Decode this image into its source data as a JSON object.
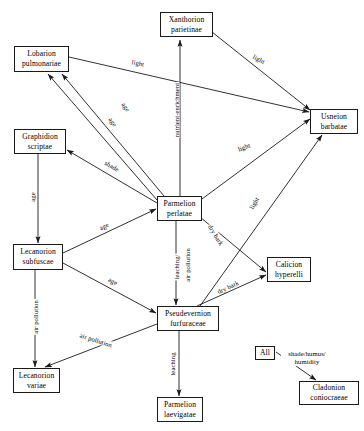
{
  "diagram": {
    "type": "directed-graph",
    "width": 364,
    "height": 431,
    "stroke_color": "#1a1a1a",
    "background_color": "#ffffff",
    "nodes": [
      {
        "id": "xanthorion",
        "lines": [
          "Xanthorion",
          "parietinae"
        ],
        "x": 160,
        "y": 12,
        "w": 53,
        "h": 25
      },
      {
        "id": "lobarion",
        "lines": [
          "Lobarion",
          "pulmonariae"
        ],
        "x": 14,
        "y": 46,
        "w": 55,
        "h": 26
      },
      {
        "id": "usneion",
        "lines": [
          "Usneion",
          "barbatae"
        ],
        "x": 310,
        "y": 109,
        "w": 48,
        "h": 25
      },
      {
        "id": "graphidion",
        "lines": [
          "Graphidion",
          "scriptae"
        ],
        "x": 14,
        "y": 129,
        "w": 52,
        "h": 25
      },
      {
        "id": "parmelion_p",
        "lines": [
          "Parmelion",
          "perlatae"
        ],
        "x": 157,
        "y": 196,
        "w": 45,
        "h": 25
      },
      {
        "id": "lecanorion_s",
        "lines": [
          "Lecanorion",
          "subfuscae"
        ],
        "x": 13,
        "y": 244,
        "w": 50,
        "h": 26
      },
      {
        "id": "calicion",
        "lines": [
          "Calicion",
          "hyperelli"
        ],
        "x": 267,
        "y": 257,
        "w": 44,
        "h": 25
      },
      {
        "id": "pseudevernion",
        "lines": [
          "Pseudevernion",
          "furfuraceae"
        ],
        "x": 157,
        "y": 306,
        "w": 62,
        "h": 25
      },
      {
        "id": "all",
        "lines": [
          "All"
        ],
        "x": 255,
        "y": 346,
        "w": 20,
        "h": 14
      },
      {
        "id": "lecanorion_v",
        "lines": [
          "Lecanorion",
          "variae"
        ],
        "x": 13,
        "y": 368,
        "w": 47,
        "h": 25
      },
      {
        "id": "cladonion",
        "lines": [
          "Cladonion",
          "coniocraeae"
        ],
        "x": 299,
        "y": 381,
        "w": 60,
        "h": 24
      },
      {
        "id": "parmelion_l",
        "lines": [
          "Parmelion",
          "laevigatae"
        ],
        "x": 157,
        "y": 397,
        "w": 46,
        "h": 25
      }
    ],
    "edges": [
      {
        "id": "e1",
        "from": "lobarion",
        "to": "usneion",
        "label": "light",
        "label_x": 138,
        "label_y": 63,
        "label_rot": 11,
        "x1": 69,
        "y1": 57,
        "x2": 309,
        "y2": 112
      },
      {
        "id": "e2",
        "from": "xanthorion",
        "to": "usneion",
        "label": "light",
        "label_x": 259,
        "label_y": 59,
        "label_rot": 27,
        "x1": 212,
        "y1": 32,
        "x2": 310,
        "y2": 110
      },
      {
        "id": "e3",
        "from": "parmelion_p",
        "to": "xanthorion",
        "label": "nutrient-enrichment",
        "label_x": 176,
        "label_y": 110,
        "label_rot": -90,
        "x1": 180,
        "y1": 196,
        "x2": 180,
        "y2": 40
      },
      {
        "id": "e4",
        "from": "parmelion_p",
        "to": "lobarion",
        "label": "age",
        "label_x": 126,
        "label_y": 107,
        "label_rot": 55,
        "x1": 164,
        "y1": 196,
        "x2": 62,
        "y2": 74
      },
      {
        "id": "e5",
        "from": "parmelion_p",
        "to": "lobarion",
        "label": "age",
        "label_x": 113,
        "label_y": 122,
        "label_rot": 55,
        "x1": 157,
        "y1": 200,
        "x2": 48,
        "y2": 74
      },
      {
        "id": "e6",
        "from": "parmelion_p",
        "to": "graphidion",
        "label": "shade",
        "label_x": 112,
        "label_y": 166,
        "label_rot": 31,
        "x1": 157,
        "y1": 203,
        "x2": 67,
        "y2": 150
      },
      {
        "id": "e7",
        "from": "lecanorion_s",
        "to": "parmelion_p",
        "label": "age",
        "label_x": 104,
        "label_y": 226,
        "label_rot": -24,
        "x1": 63,
        "y1": 253,
        "x2": 156,
        "y2": 209
      },
      {
        "id": "e8",
        "from": "graphidion",
        "to": "lecanorion_s",
        "label": "age",
        "label_x": 32,
        "label_y": 197,
        "label_rot": -90,
        "x1": 38,
        "y1": 154,
        "x2": 38,
        "y2": 243
      },
      {
        "id": "e9",
        "from": "parmelion_p",
        "to": "usneion",
        "label": "light",
        "label_x": 244,
        "label_y": 147,
        "label_rot": -21,
        "x1": 202,
        "y1": 199,
        "x2": 310,
        "y2": 119
      },
      {
        "id": "e10",
        "from": "pseudevernion",
        "to": "usneion",
        "label": "light",
        "label_x": 254,
        "label_y": 203,
        "label_rot": -60,
        "x1": 200,
        "y1": 306,
        "x2": 322,
        "y2": 135
      },
      {
        "id": "e11",
        "from": "parmelion_p",
        "to": "calicion",
        "label": "dry bark",
        "label_x": 216,
        "label_y": 235,
        "label_rot": 58,
        "x1": 200,
        "y1": 217,
        "x2": 266,
        "y2": 272
      },
      {
        "id": "e12",
        "from": "pseudevernion",
        "to": "calicion",
        "label": "dry bark",
        "label_x": 228,
        "label_y": 287,
        "label_rot": -25,
        "x1": 197,
        "y1": 306,
        "x2": 266,
        "y2": 275
      },
      {
        "id": "e13",
        "from": "parmelion_p",
        "to": "pseudevernion",
        "label": "leaching/",
        "label_x": 176,
        "label_y": 267,
        "label_rot": -90,
        "x1": 176,
        "y1": 221,
        "x2": 176,
        "y2": 305
      },
      {
        "id": "e14",
        "from": "parmelion_p",
        "to": "pseudevernion",
        "label": "air pollution",
        "label_x": 187,
        "label_y": 265,
        "label_rot": -90,
        "x1": 176,
        "y1": 221,
        "x2": 176,
        "y2": 305
      },
      {
        "id": "e15",
        "from": "lecanorion_s",
        "to": "pseudevernion",
        "label": "age",
        "label_x": 113,
        "label_y": 281,
        "label_rot": 27,
        "x1": 63,
        "y1": 263,
        "x2": 156,
        "y2": 313
      },
      {
        "id": "e16",
        "from": "lecanorion_s",
        "to": "lecanorion_v",
        "label": "air pollution",
        "label_x": 35,
        "label_y": 317,
        "label_rot": -90,
        "x1": 35,
        "y1": 270,
        "x2": 35,
        "y2": 367
      },
      {
        "id": "e17",
        "from": "pseudevernion",
        "to": "lecanorion_v",
        "label": "air pollution",
        "label_x": 96,
        "label_y": 340,
        "label_rot": 18,
        "x1": 157,
        "y1": 324,
        "x2": 45,
        "y2": 367
      },
      {
        "id": "e18",
        "from": "pseudevernion",
        "to": "parmelion_l",
        "label": "leaching",
        "label_x": 172,
        "label_y": 364,
        "label_rot": -90,
        "x1": 179,
        "y1": 331,
        "x2": 179,
        "y2": 396
      },
      {
        "id": "e19",
        "from": "all",
        "to": "cladonion",
        "label": "shade/humus/ humidity",
        "label_x": 307,
        "label_y": 358,
        "label_rot": 0,
        "x1": 276,
        "y1": 352,
        "x2": 316,
        "y2": 380
      }
    ]
  }
}
